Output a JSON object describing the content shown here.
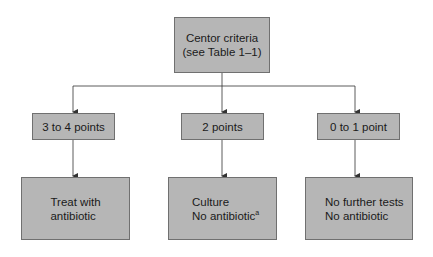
{
  "colors": {
    "box_fill": "#b6b6b6",
    "box_border": "#707070",
    "line": "#333333",
    "text": "#1a1a1a"
  },
  "root": {
    "lines": [
      "Centor criteria",
      "(see Table 1–1)"
    ]
  },
  "scores": [
    {
      "label": "3 to 4 points"
    },
    {
      "label": "2 points"
    },
    {
      "label": "0 to 1 point"
    }
  ],
  "actions": [
    {
      "lines": [
        "Treat with",
        "antibiotic"
      ],
      "footnote": ""
    },
    {
      "lines": [
        "Culture",
        "No antibiotic"
      ],
      "footnote": "a"
    },
    {
      "lines": [
        "No further tests",
        "No antibiotic"
      ],
      "footnote": ""
    }
  ]
}
